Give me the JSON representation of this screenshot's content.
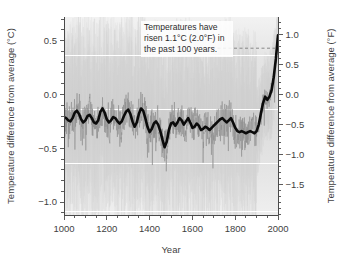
{
  "chart_data": {
    "type": "line",
    "title": "",
    "xlabel": "Year",
    "ylabel": "Temperature difference from average (°C)",
    "ylabel_secondary": "Temperature difference from average (°F)",
    "xlim": [
      1000,
      2000
    ],
    "ylim": [
      -1.12,
      0.72
    ],
    "ylim_secondary": [
      -2.016,
      1.296
    ],
    "grid": true,
    "grid_color": "#ffffff",
    "legend": "none",
    "xticks": [
      1000,
      1200,
      1400,
      1600,
      1800,
      2000
    ],
    "xtick_labels": [
      "1000",
      "1200",
      "1400",
      "1600",
      "1800",
      "2000"
    ],
    "xminor_step": 50,
    "yticks": [
      0.5,
      0.0,
      -0.5,
      -1.0
    ],
    "ytick_labels": [
      "0.5",
      "0.0",
      "−0.5",
      "−1.0"
    ],
    "yminor_step": 0.1,
    "yticks_secondary": [
      1.0,
      0.5,
      0.0,
      -0.5,
      -1.0,
      -1.5
    ],
    "ytick_labels_secondary": [
      "1.0",
      "0.5",
      "0.0",
      "−0.5",
      "−1.0",
      "−1.5"
    ],
    "yminor_step_secondary": 0.1,
    "annotation": {
      "line1": "Temperatures have",
      "line2": "risen 1.1°C (2.0°F) in",
      "line3": "the past 100 years.",
      "leader_from_year": 1880,
      "leader_to_year": 2000,
      "leader_value": 0.56
    },
    "series": [
      {
        "name": "smoothed-reconstruction",
        "role": "smoothed 40-year mean",
        "color": "#0b0b0b",
        "x": [
          1000,
          1010,
          1020,
          1030,
          1040,
          1050,
          1060,
          1070,
          1080,
          1090,
          1100,
          1110,
          1120,
          1130,
          1140,
          1150,
          1160,
          1170,
          1180,
          1190,
          1200,
          1210,
          1220,
          1230,
          1240,
          1250,
          1260,
          1270,
          1280,
          1290,
          1300,
          1310,
          1320,
          1330,
          1340,
          1350,
          1360,
          1370,
          1380,
          1390,
          1400,
          1410,
          1420,
          1430,
          1440,
          1450,
          1460,
          1470,
          1480,
          1490,
          1500,
          1510,
          1520,
          1530,
          1540,
          1550,
          1560,
          1570,
          1580,
          1590,
          1600,
          1610,
          1620,
          1630,
          1640,
          1650,
          1660,
          1670,
          1680,
          1690,
          1700,
          1710,
          1720,
          1730,
          1740,
          1750,
          1760,
          1770,
          1780,
          1790,
          1800,
          1810,
          1820,
          1830,
          1840,
          1850,
          1860,
          1870,
          1880,
          1890,
          1900,
          1910,
          1920,
          1930,
          1940,
          1950,
          1960,
          1970,
          1980,
          1990,
          2000
        ],
        "y": [
          -0.21,
          -0.22,
          -0.24,
          -0.25,
          -0.22,
          -0.17,
          -0.15,
          -0.18,
          -0.23,
          -0.26,
          -0.24,
          -0.2,
          -0.19,
          -0.22,
          -0.26,
          -0.27,
          -0.24,
          -0.16,
          -0.13,
          -0.17,
          -0.23,
          -0.26,
          -0.24,
          -0.21,
          -0.22,
          -0.25,
          -0.27,
          -0.25,
          -0.2,
          -0.16,
          -0.14,
          -0.18,
          -0.25,
          -0.3,
          -0.26,
          -0.18,
          -0.13,
          -0.15,
          -0.22,
          -0.3,
          -0.35,
          -0.32,
          -0.27,
          -0.25,
          -0.28,
          -0.34,
          -0.42,
          -0.49,
          -0.44,
          -0.33,
          -0.27,
          -0.26,
          -0.29,
          -0.26,
          -0.22,
          -0.24,
          -0.28,
          -0.25,
          -0.22,
          -0.26,
          -0.31,
          -0.3,
          -0.27,
          -0.29,
          -0.33,
          -0.32,
          -0.3,
          -0.31,
          -0.33,
          -0.31,
          -0.29,
          -0.27,
          -0.25,
          -0.23,
          -0.22,
          -0.24,
          -0.26,
          -0.24,
          -0.22,
          -0.26,
          -0.31,
          -0.34,
          -0.35,
          -0.34,
          -0.35,
          -0.36,
          -0.35,
          -0.34,
          -0.35,
          -0.36,
          -0.34,
          -0.28,
          -0.18,
          -0.08,
          -0.02,
          -0.05,
          -0.02,
          0.04,
          0.16,
          0.33,
          0.55
        ]
      },
      {
        "name": "annual-reconstruction",
        "role": "annual values (noisy grey)",
        "color": "#8d8d8d"
      },
      {
        "name": "uncertainty-band",
        "role": "uncertainty range (pale grey shading)",
        "color": "#d9d9d9"
      }
    ]
  }
}
